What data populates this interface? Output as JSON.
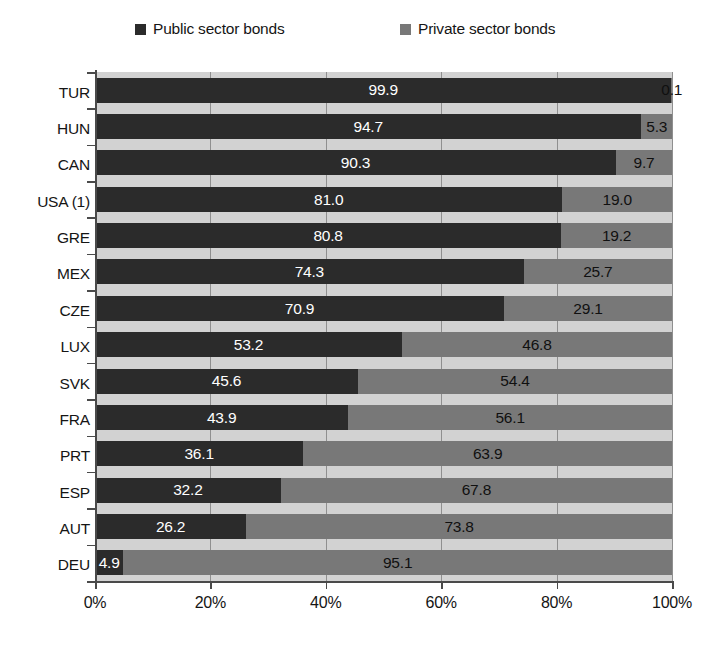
{
  "chart_data": {
    "type": "bar",
    "orientation": "horizontal",
    "stacked": true,
    "normalized_percent": true,
    "title": "",
    "xlabel": "",
    "ylabel": "",
    "xlim": [
      0,
      100
    ],
    "grid": true,
    "legend_position": "top",
    "legend": [
      {
        "name": "Public sector bonds",
        "color": "#2b2b2b",
        "swatch": "legend-swatch-public"
      },
      {
        "name": "Private sector bonds",
        "color": "#787878",
        "swatch": "legend-swatch-private"
      }
    ],
    "categories": [
      "TUR",
      "HUN",
      "CAN",
      "USA (1)",
      "GRE",
      "MEX",
      "CZE",
      "LUX",
      "SVK",
      "FRA",
      "PRT",
      "ESP",
      "AUT",
      "DEU"
    ],
    "series": [
      {
        "name": "Public sector bonds",
        "values": [
          99.9,
          94.7,
          90.3,
          81.0,
          80.8,
          74.3,
          70.9,
          53.2,
          45.6,
          43.9,
          36.1,
          32.2,
          26.2,
          4.9
        ]
      },
      {
        "name": "Private sector bonds",
        "values": [
          0.1,
          5.3,
          9.7,
          19.0,
          19.2,
          25.7,
          29.1,
          46.8,
          54.4,
          56.1,
          63.9,
          67.8,
          73.8,
          95.1
        ]
      }
    ],
    "value_labels": {
      "public": [
        "99.9",
        "94.7",
        "90.3",
        "81.0",
        "80.8",
        "74.3",
        "70.9",
        "53.2",
        "45.6",
        "43.9",
        "36.1",
        "32.2",
        "26.2",
        "4.9"
      ],
      "private": [
        "0.1",
        "5.3",
        "9.7",
        "19.0",
        "19.2",
        "25.7",
        "29.1",
        "46.8",
        "54.4",
        "56.1",
        "63.9",
        "67.8",
        "73.8",
        "95.1"
      ]
    },
    "xticks": [
      0,
      20,
      40,
      60,
      80,
      100
    ],
    "xticklabels": [
      "0%",
      "20%",
      "40%",
      "60%",
      "80%",
      "100%"
    ]
  },
  "colors": {
    "public": "#2b2b2b",
    "private": "#787878",
    "plot_background": "#d2d2d2",
    "axis": "#4a4a4a",
    "gridline": "#8f8f8f",
    "page_background": "#ffffff"
  }
}
